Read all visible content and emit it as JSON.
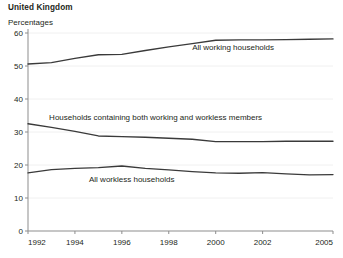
{
  "chart_data": {
    "type": "line",
    "title": "United Kingdom",
    "subtitle": "Percentages",
    "xlabel": "",
    "ylabel": "",
    "ylim": [
      0,
      60
    ],
    "xlim": [
      1992,
      2005
    ],
    "yticks": [
      0,
      10,
      20,
      30,
      40,
      50,
      60
    ],
    "ytick_labels": [
      "0",
      "10",
      "20",
      "30",
      "40",
      "50",
      "60"
    ],
    "xticks": [
      1992,
      1994,
      1996,
      1998,
      2000,
      2002,
      2005
    ],
    "xtick_labels": [
      "1992",
      "1994",
      "1996",
      "1998",
      "2000",
      "2002",
      "2005"
    ],
    "grid": true,
    "grid_axis": "y",
    "legend": "inline-annotations",
    "x": [
      1992,
      1993,
      1994,
      1995,
      1996,
      1997,
      1998,
      1999,
      2000,
      2001,
      2002,
      2003,
      2004,
      2005
    ],
    "series": [
      {
        "name": "All working households",
        "label": "All working households",
        "color": "#3a3a3a",
        "values": [
          50.6,
          51.0,
          52.3,
          53.4,
          53.5,
          54.7,
          55.8,
          56.8,
          57.8,
          57.9,
          57.9,
          58.0,
          58.1,
          58.2
        ]
      },
      {
        "name": "Households containing both working and workless members",
        "label": "Households containing both working and workless members",
        "color": "#3a3a3a",
        "values": [
          32.5,
          31.4,
          30.2,
          28.8,
          28.6,
          28.4,
          28.1,
          27.8,
          27.1,
          27.1,
          27.1,
          27.2,
          27.2,
          27.2
        ]
      },
      {
        "name": "All workless households",
        "label": "All workless households",
        "color": "#3a3a3a",
        "values": [
          17.6,
          18.6,
          19.0,
          19.2,
          19.7,
          19.0,
          18.5,
          18.0,
          17.6,
          17.5,
          17.7,
          17.3,
          17.0,
          17.1
        ]
      }
    ],
    "annotations": [
      {
        "text": "All working households",
        "x": 1999.0,
        "y": 55.0
      },
      {
        "text": "Households containing both working and workless members",
        "x": 1992.9,
        "y": 33.6
      },
      {
        "text": "All workless households",
        "x": 1994.6,
        "y": 15.0
      }
    ],
    "colors": {
      "line": "#3a3a3a",
      "grid": "#ececec",
      "axis": "#8d8d8d",
      "text": "#231f20",
      "background": "#ffffff"
    }
  }
}
